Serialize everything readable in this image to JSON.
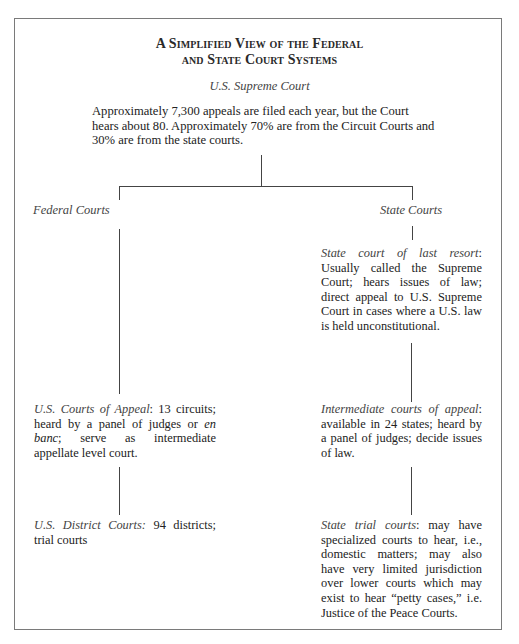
{
  "title": {
    "line1": "A Simplified View of the Federal",
    "line2": "and State Court Systems"
  },
  "supreme_court": {
    "label": "U.S. Supreme Court",
    "description": "Approximately 7,300 appeals are filed each year, but the Court hears about 80. Approximately 70% are from the Circuit Courts and 30% are from the state courts."
  },
  "federal": {
    "label": "Federal Courts",
    "courts_of_appeal": {
      "lead": "U.S. Courts of Appeal",
      "text_1": ": 13 circuits; heard by a panel of judges or ",
      "emphasis": "en banc",
      "text_2": "; serve as intermediate appellate level court."
    },
    "district_courts": {
      "lead": "U.S. District Courts:",
      "text": " 94 districts; trial courts"
    }
  },
  "state": {
    "label": "State Courts",
    "last_resort": {
      "lead": "State court of last resort",
      "text": ": Usually called the Supreme Court; hears issues of law; direct appeal to U.S. Supreme Court in cases where a U.S. law is held unconstitutional."
    },
    "intermediate": {
      "lead": "Intermediate courts of appeal",
      "text": ": available in 24 states; heard by a panel of judges; decide issues of law."
    },
    "trial": {
      "lead": "State trial courts",
      "text": ": may have specialized courts to hear, i.e., domestic matters; may also have very limited jurisdiction over lower courts which may exist to hear “petty cases,” i.e. Justice of the Peace Courts."
    }
  }
}
